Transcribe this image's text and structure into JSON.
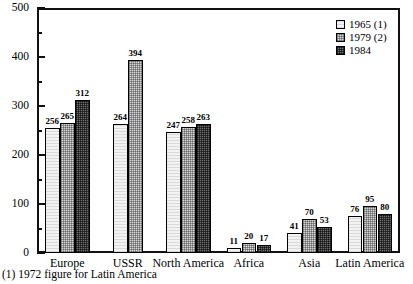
{
  "chart_data": {
    "type": "bar",
    "title": "",
    "subtitle": "",
    "xlabel": "",
    "ylabel": "",
    "ylim": [
      0,
      500
    ],
    "grid": false,
    "legend_position": "top-right",
    "y_ticks_major": [
      0,
      100,
      200,
      300,
      400,
      500
    ],
    "y_ticks_minor": [
      50,
      150,
      250,
      350,
      450
    ],
    "categories": [
      "Europe",
      "USSR",
      "North America",
      "Africa",
      "Asia",
      "Latin America"
    ],
    "series": [
      {
        "name": "1965 (1)",
        "pattern": "light-dotted",
        "values": [
          256,
          264,
          247,
          11,
          41,
          76
        ]
      },
      {
        "name": "1979 (2)",
        "pattern": "mid-checker",
        "values": [
          265,
          394,
          258,
          20,
          70,
          95
        ]
      },
      {
        "name": "1984",
        "pattern": "dark-checker",
        "values": [
          312,
          null,
          263,
          17,
          53,
          80
        ]
      }
    ],
    "annotations": [
      "(1) 1972 figure for Latin America"
    ]
  },
  "axis": {
    "y_labels": [
      "500",
      "400",
      "300",
      "200",
      "100",
      "0"
    ]
  },
  "legend": {
    "entries": [
      {
        "label": "1965 (1)"
      },
      {
        "label": "1979 (2)"
      },
      {
        "label": "1984"
      }
    ]
  },
  "footnote": {
    "text": "(1) 1972 figure for Latin America"
  },
  "colors": {
    "series_1965": "#f2f2f2",
    "series_1979": "#d6d6d6",
    "series_1984": "#6e6e6e",
    "frame": "#111111",
    "text": "#000000"
  }
}
